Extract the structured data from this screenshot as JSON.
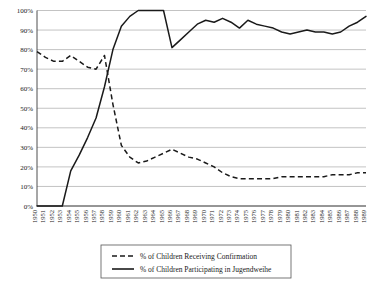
{
  "chart_data": {
    "type": "line",
    "title": "",
    "subtitle": "",
    "xlabel": "",
    "ylabel": "",
    "ylim": [
      0,
      100
    ],
    "ytick_labels": [
      "100%",
      "90%",
      "80%",
      "70%",
      "60%",
      "50%",
      "40%",
      "30%",
      "20%",
      "10%",
      "0%"
    ],
    "ytick_values": [
      100,
      90,
      80,
      70,
      60,
      50,
      40,
      30,
      20,
      10,
      0
    ],
    "grid": "horizontal",
    "legend_position": "bottom-center",
    "categories": [
      "1950",
      "1951",
      "1952",
      "1953",
      "1954",
      "1955",
      "1956",
      "1957",
      "1958",
      "1959",
      "1960",
      "1961",
      "1962",
      "1963",
      "1964",
      "1965",
      "1966",
      "1967",
      "1968",
      "1969",
      "1970",
      "1971",
      "1972",
      "1973",
      "1974",
      "1975",
      "1976",
      "1977",
      "1978",
      "1979",
      "1980",
      "1981",
      "1982",
      "1983",
      "1984",
      "1985",
      "1986",
      "1987",
      "1988",
      "1989"
    ],
    "series": [
      {
        "name": "% of Children Receiving Confirmation",
        "style": "dashed",
        "color": "#1a1a1a",
        "values": [
          79,
          76,
          74,
          74,
          77,
          74,
          71,
          70,
          77,
          52,
          31,
          25,
          22,
          23,
          25,
          27,
          29,
          27,
          25,
          24,
          22,
          20,
          17,
          15,
          14,
          14,
          14,
          14,
          14,
          15,
          15,
          15,
          15,
          15,
          15,
          16,
          16,
          16,
          17,
          17
        ]
      },
      {
        "name": "% of Children Participating in Jugendweihe",
        "style": "solid",
        "color": "#1a1a1a",
        "values": [
          0,
          0,
          0,
          0,
          18,
          26,
          35,
          45,
          61,
          80,
          92,
          97,
          100,
          100,
          100,
          100,
          81,
          85,
          89,
          93,
          95,
          94,
          96,
          94,
          91,
          95,
          93,
          92,
          91,
          89,
          88,
          89,
          90,
          89,
          89,
          88,
          89,
          92,
          94,
          97
        ]
      }
    ]
  },
  "legend": {
    "items": [
      {
        "label": "% of Children Receiving Confirmation",
        "style": "dashed"
      },
      {
        "label": "% of Children Participating in Jugendweihe",
        "style": "solid"
      }
    ]
  }
}
